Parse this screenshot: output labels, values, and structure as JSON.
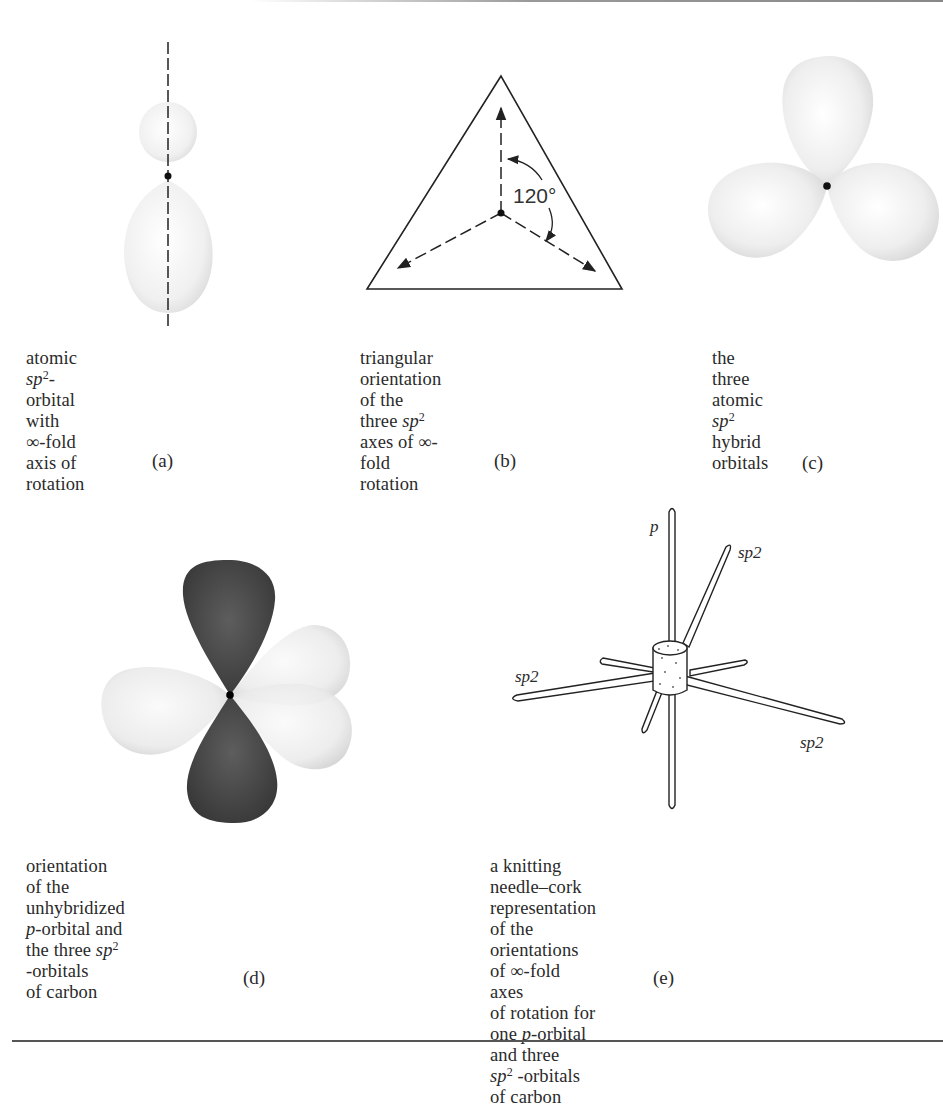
{
  "figure": {
    "panels": [
      {
        "id": "a",
        "letter": "(a)",
        "caption": {
          "line1_pre": "atomic ",
          "line1_italic": "sp",
          "line1_sup": "2",
          "line1_post": "-orbital with",
          "line2": "∞-fold axis of rotation"
        },
        "diagram": "single sp2 orbital lobe pair on dashed vertical axis"
      },
      {
        "id": "b",
        "letter": "(b)",
        "caption": {
          "line1": "triangular orientation of the",
          "line2_pre": "three ",
          "line2_italic": "sp",
          "line2_sup": "2",
          "line2_post": " axes of ∞-fold",
          "line3": "rotation"
        },
        "angle_label": "120°",
        "diagram": "equilateral triangle with three dashed arrows from center"
      },
      {
        "id": "c",
        "letter": "(c)",
        "caption": {
          "line1_pre": "the three atomic ",
          "line1_italic": "sp",
          "line1_sup": "2",
          "line2": "hybrid orbitals"
        },
        "diagram": "three sp2 lobes at 120 degrees"
      },
      {
        "id": "d",
        "letter": "(d)",
        "caption": {
          "line1": "orientation of the unhybridized",
          "line2_italic": "p",
          "line2_pre": "-orbital and the three ",
          "line2_italic2": "sp",
          "line2_sup": "2",
          "line2_post": " -orbitals",
          "line3": "of carbon"
        },
        "diagram": "dark p-orbital with three light sp2 lobes"
      },
      {
        "id": "e",
        "letter": "(e)",
        "caption": {
          "line1": "a knitting needle–cork representation",
          "line2": "of the orientations of ∞-fold axes",
          "line3_pre": "of rotation for one ",
          "line3_italic": "p",
          "line3_post": "-orbital and three",
          "line4_italic": "sp",
          "line4_sup": "2",
          "line4_post": " -orbitals of carbon"
        },
        "needle_labels": {
          "p": "p",
          "sp2_upper_right": "sp2",
          "sp2_left": "sp2",
          "sp2_lower_right": "sp2"
        },
        "diagram": "cork with needles for p and sp2 axes"
      }
    ]
  }
}
